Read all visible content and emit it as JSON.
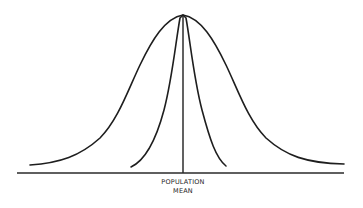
{
  "diagram": {
    "type": "normal-distribution-comparison",
    "curves": [
      {
        "name": "wide-distribution",
        "shape": "bell",
        "center_x": 183,
        "peak_y": 15,
        "left_end": [
          30,
          165
        ],
        "right_end": [
          344,
          164
        ]
      },
      {
        "name": "narrow-distribution",
        "shape": "bell",
        "center_x": 183,
        "peak_y": 15,
        "left_end": [
          131,
          167
        ],
        "right_end": [
          226,
          166
        ]
      }
    ],
    "axis": {
      "x1": 17,
      "x2": 344,
      "y": 173
    },
    "mean_line": {
      "x": 183,
      "y_top": 15,
      "y_bottom": 173
    },
    "labels": {
      "mean_line1": "POPULATION",
      "mean_line2": "MEAN"
    }
  }
}
